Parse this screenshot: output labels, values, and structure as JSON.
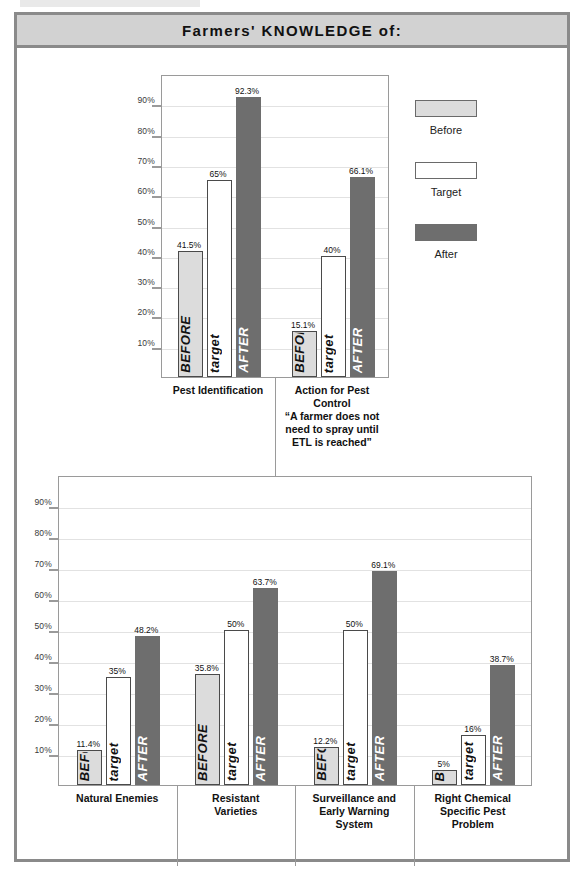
{
  "header": {
    "title": "Farmers' KNOWLEDGE of:"
  },
  "legend": {
    "items": [
      {
        "label": "Before",
        "key": "before",
        "color": "#dcdcdc"
      },
      {
        "label": "Target",
        "key": "target",
        "color": "#ffffff"
      },
      {
        "label": "After",
        "key": "after",
        "color": "#6e6e6e"
      }
    ]
  },
  "bar_text": {
    "before": "BEFORE",
    "target": "target",
    "after": "AFTER"
  },
  "chart_data": [
    {
      "id": "top-chart",
      "type": "bar",
      "title": "Farmers' KNOWLEDGE of:",
      "ylabel": "",
      "xlabel": "",
      "ylim": [
        0,
        100
      ],
      "yticks": [
        "10%",
        "20%",
        "30%",
        "40%",
        "50%",
        "60%",
        "70%",
        "80%",
        "90%"
      ],
      "ytick_values": [
        10,
        20,
        30,
        40,
        50,
        60,
        70,
        80,
        90
      ],
      "grid": true,
      "legend": [
        "Before",
        "Target",
        "After"
      ],
      "categories": [
        "Pest Identification",
        "Action for Pest Control “A farmer does not need to spray until ETL is reached”"
      ],
      "category_lines": [
        [
          "Pest Identification"
        ],
        [
          "Action for Pest",
          "Control",
          "“A farmer does not",
          "need to spray until",
          "ETL is reached”"
        ]
      ],
      "series": [
        {
          "name": "Before",
          "values": [
            41.5,
            15.1
          ],
          "labels": [
            "41.5%",
            "15.1%"
          ]
        },
        {
          "name": "Target",
          "values": [
            65,
            40
          ],
          "labels": [
            "65%",
            "40%"
          ]
        },
        {
          "name": "After",
          "values": [
            92.3,
            66.1
          ],
          "labels": [
            "92.3%",
            "66.1%"
          ]
        }
      ]
    },
    {
      "id": "bottom-chart",
      "type": "bar",
      "title": "",
      "ylabel": "",
      "xlabel": "",
      "ylim": [
        0,
        100
      ],
      "yticks": [
        "10%",
        "20%",
        "30%",
        "40%",
        "50%",
        "60%",
        "70%",
        "80%",
        "90%"
      ],
      "ytick_values": [
        10,
        20,
        30,
        40,
        50,
        60,
        70,
        80,
        90
      ],
      "grid": true,
      "legend": [
        "Before",
        "Target",
        "After"
      ],
      "categories": [
        "Natural Enemies",
        "Resistant Varieties",
        "Surveillance and Early Warning System",
        "Right Chemical Specific Pest Problem"
      ],
      "category_lines": [
        [
          "Natural Enemies"
        ],
        [
          "Resistant",
          "Varieties"
        ],
        [
          "Surveillance and",
          "Early Warning",
          "System"
        ],
        [
          "Right Chemical",
          "Specific Pest",
          "Problem"
        ]
      ],
      "series": [
        {
          "name": "Before",
          "values": [
            11.4,
            35.8,
            12.2,
            5
          ],
          "labels": [
            "11.4%",
            "35.8%",
            "12.2%",
            "5%"
          ]
        },
        {
          "name": "Target",
          "values": [
            35,
            50,
            50,
            16
          ],
          "labels": [
            "35%",
            "50%",
            "50%",
            "16%"
          ]
        },
        {
          "name": "After",
          "values": [
            48.2,
            63.7,
            69.1,
            38.7
          ],
          "labels": [
            "48.2%",
            "63.7%",
            "69.1%",
            "38.7%"
          ]
        }
      ]
    }
  ]
}
